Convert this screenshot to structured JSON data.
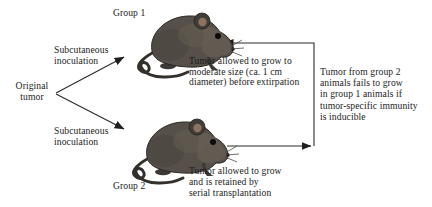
{
  "figure": {
    "background_color": "#ffffff",
    "text_color": "#1b1b1b",
    "arrow_color": "#2a2a2a",
    "mouse_body_color": "#57504a",
    "labels": {
      "group1": "Group 1",
      "group2": "Group 2"
    },
    "source": {
      "line1": "Original",
      "line2": "tumor"
    },
    "inoculation_top": {
      "line1": "Subcutaneous",
      "line2": "inoculation"
    },
    "inoculation_bottom": {
      "line1": "Subcutaneous",
      "line2": "inoculation"
    },
    "notes": {
      "group1_note": [
        "Tumor allowed to grow to",
        "moderate size (ca. 1 cm",
        "diameter) before extirpation"
      ],
      "transfer_note": [
        "Tumor from group 2",
        "animals fails to grow",
        "in group 1 animals if",
        "tumor-specific immunity",
        "is inducible"
      ],
      "group2_note": [
        "Tumor allowed to grow",
        "and is retained by",
        "serial transplantation"
      ]
    },
    "icons": {
      "mouse1": "mouse-facing-right",
      "mouse2": "mouse-facing-right"
    }
  }
}
